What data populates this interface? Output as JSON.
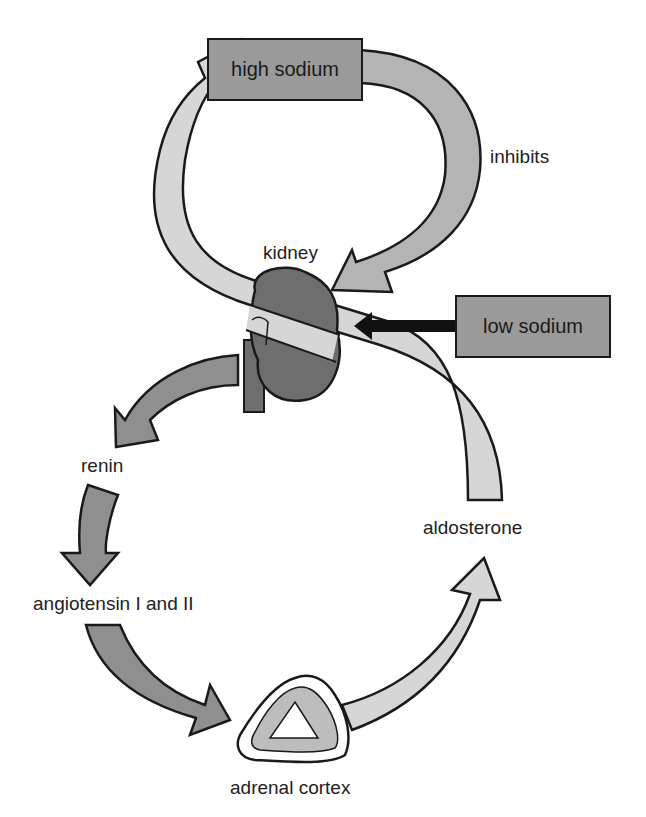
{
  "diagram": {
    "type": "feedback-loop",
    "nodes": {
      "high_sodium": "high sodium",
      "low_sodium": "low sodium",
      "kidney": "kidney",
      "renin": "renin",
      "angiotensin": "angiotensin I and II",
      "adrenal_cortex": "adrenal cortex",
      "aldosterone": "aldosterone"
    },
    "edge_labels": {
      "inhibits": "inhibits"
    },
    "edges": [
      {
        "from": "high sodium",
        "to": "kidney",
        "label": "inhibits"
      },
      {
        "from": "low sodium",
        "to": "kidney",
        "label": ""
      },
      {
        "from": "kidney",
        "to": "renin",
        "label": ""
      },
      {
        "from": "renin",
        "to": "angiotensin I and II",
        "label": ""
      },
      {
        "from": "angiotensin I and II",
        "to": "adrenal cortex",
        "label": ""
      },
      {
        "from": "adrenal cortex",
        "to": "aldosterone",
        "label": ""
      },
      {
        "from": "aldosterone",
        "to": "high sodium",
        "label": ""
      }
    ],
    "colors": {
      "light_arrow": "#d6d6d6",
      "mid_arrow": "#b0b0b0",
      "dark_arrow": "#8f8f8f",
      "kidney": "#6e6e6e",
      "box": "#9a9a9a",
      "stroke": "#1a1a1a"
    }
  }
}
